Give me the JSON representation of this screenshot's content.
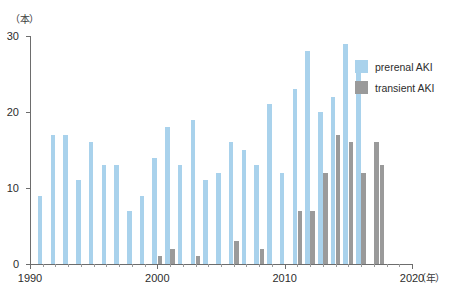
{
  "chart_data": {
    "type": "bar",
    "title": "",
    "subtitle": "",
    "xlabel": "（年）",
    "ylabel": "（本）",
    "xlim": [
      1990,
      2020
    ],
    "ylim": [
      0,
      30
    ],
    "grid": false,
    "legend_position": "right",
    "y_ticks": [
      0,
      10,
      20,
      30
    ],
    "x_ticks": [
      1990,
      2000,
      2010,
      2020
    ],
    "x": [
      1991,
      1992,
      1993,
      1994,
      1995,
      1996,
      1997,
      1998,
      1999,
      2000,
      2001,
      2002,
      2003,
      2004,
      2005,
      2006,
      2007,
      2008,
      2009,
      2010,
      2011,
      2012,
      2013,
      2014,
      2015,
      2016,
      2017
    ],
    "series": [
      {
        "name": "prerenal AKI",
        "color": "#a9d2ec",
        "values": [
          9,
          17,
          17,
          11,
          16,
          13,
          13,
          7,
          9,
          14,
          18,
          13,
          19,
          11,
          12,
          16,
          15,
          13,
          21,
          12,
          23,
          28,
          20,
          22,
          29,
          26,
          0
        ]
      },
      {
        "name": "transient AKI",
        "color": "#9a9a9a",
        "values": [
          0,
          0,
          0,
          0,
          0,
          0,
          0,
          0,
          0,
          1,
          2,
          0,
          1,
          0,
          0,
          3,
          0,
          2,
          0,
          0,
          7,
          7,
          12,
          17,
          16,
          12,
          16
        ]
      },
      {
        "name": "transient AKI trailing",
        "color": "#9a9a9a",
        "values": [
          0,
          0,
          0,
          0,
          0,
          0,
          0,
          0,
          0,
          0,
          0,
          0,
          0,
          0,
          0,
          0,
          0,
          0,
          0,
          0,
          0,
          0,
          0,
          0,
          0,
          0,
          13
        ]
      }
    ]
  },
  "legend": {
    "items": [
      {
        "label": "prerenal AKI",
        "color": "#a9d2ec"
      },
      {
        "label": "transient AKI",
        "color": "#9a9a9a"
      }
    ]
  },
  "axes": {
    "y_unit": "（本）",
    "x_unit": "（年）",
    "y_tick_labels": [
      "0",
      "10",
      "20",
      "30"
    ],
    "x_tick_labels": [
      "1990",
      "2000",
      "2010",
      "2020"
    ]
  }
}
